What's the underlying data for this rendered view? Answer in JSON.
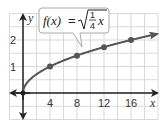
{
  "chart_data": {
    "type": "line",
    "title": "",
    "function_label": "f(x) = √(1/4 x)",
    "formula": {
      "lhs": "f(x)",
      "equals": "=",
      "frac_num": "1",
      "frac_den": "4",
      "var": "x"
    },
    "xlabel": "x",
    "ylabel": "y",
    "xlim": [
      -2,
      20
    ],
    "ylim": [
      -1,
      3
    ],
    "x_ticks": [
      4,
      8,
      12,
      16
    ],
    "y_ticks": [
      1,
      2
    ],
    "x_tick_labels": [
      "4",
      "8",
      "12",
      "16"
    ],
    "y_tick_labels": [
      "1",
      "2"
    ],
    "grid": true,
    "grid_step_x": 2,
    "grid_step_y": 0.5,
    "series": [
      {
        "name": "f(x) = sqrt(x/4)",
        "points": [
          [
            0,
            0
          ],
          [
            4,
            1
          ],
          [
            8,
            1.41
          ],
          [
            12,
            1.73
          ],
          [
            16,
            2
          ]
        ],
        "marked_points": [
          [
            0,
            0
          ],
          [
            4,
            1
          ],
          [
            8,
            1.41
          ],
          [
            12,
            1.73
          ],
          [
            16,
            2
          ]
        ],
        "arrow_end": true
      }
    ],
    "colors": {
      "curve": "#555555",
      "point": "#555555",
      "axis": "#222222",
      "grid": "#d9d9d9",
      "callout_border": "#aaaaaa"
    }
  }
}
